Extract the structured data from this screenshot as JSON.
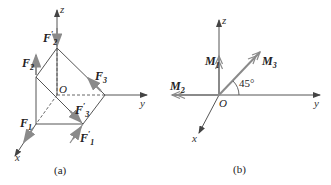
{
  "colors": {
    "line": "#555555",
    "force_arrow": "#8a8a8a",
    "text": "#222222"
  },
  "diagram_a": {
    "caption": "(a)",
    "origin_label": "O",
    "axes": {
      "x": "x",
      "y": "y",
      "z": "z"
    },
    "forces": [
      {
        "name": "F",
        "sub": "1",
        "prime": ""
      },
      {
        "name": "F",
        "sub": "1",
        "prime": "′"
      },
      {
        "name": "F",
        "sub": "2",
        "prime": ""
      },
      {
        "name": "F",
        "sub": "2",
        "prime": "′"
      },
      {
        "name": "F",
        "sub": "3",
        "prime": ""
      },
      {
        "name": "F",
        "sub": "3",
        "prime": "′"
      }
    ]
  },
  "diagram_b": {
    "caption": "(b)",
    "origin_label": "O",
    "axes": {
      "x": "x",
      "y": "y",
      "z": "z"
    },
    "moments": [
      {
        "name": "M",
        "sub": "1"
      },
      {
        "name": "M",
        "sub": "2"
      },
      {
        "name": "M",
        "sub": "3"
      }
    ],
    "angle_label": "45°"
  }
}
